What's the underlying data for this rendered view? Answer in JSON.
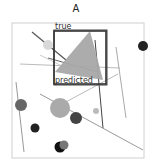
{
  "panel": {
    "label": "A"
  },
  "scene": {
    "frame": {
      "x": 12,
      "y": 23,
      "w": 132,
      "h": 135,
      "stroke": "#d0d0d0"
    },
    "boxes": {
      "true_label": "true",
      "predicted_label": "predicted",
      "true_box": {
        "x": 54,
        "y": 30,
        "w": 53,
        "h": 55,
        "stroke": "#444444"
      },
      "predicted_box": {
        "x": 54,
        "y": 31,
        "w": 52,
        "h": 53,
        "stroke": "#333333"
      }
    },
    "triangle": {
      "points": "90,31 103,80 55,72",
      "fill": "#a8a8a8"
    },
    "lines": [
      {
        "x1": 32,
        "y1": 32,
        "x2": 66,
        "y2": 60,
        "stroke": "#555555",
        "w": 1.2
      },
      {
        "x1": 48,
        "y1": 58,
        "x2": 98,
        "y2": 72,
        "stroke": "#666666",
        "w": 1
      },
      {
        "x1": 20,
        "y1": 64,
        "x2": 120,
        "y2": 68,
        "stroke": "#bbbbbb",
        "w": 1
      },
      {
        "x1": 40,
        "y1": 55,
        "x2": 70,
        "y2": 70,
        "stroke": "#cccccc",
        "w": 1
      },
      {
        "x1": 95,
        "y1": 40,
        "x2": 103,
        "y2": 128,
        "stroke": "#444444",
        "w": 1
      },
      {
        "x1": 116,
        "y1": 47,
        "x2": 126,
        "y2": 118,
        "stroke": "#aaaaaa",
        "w": 1
      },
      {
        "x1": 40,
        "y1": 94,
        "x2": 143,
        "y2": 150,
        "stroke": "#999999",
        "w": 1
      },
      {
        "x1": 62,
        "y1": 104,
        "x2": 118,
        "y2": 74,
        "stroke": "#bbbbbb",
        "w": 1
      },
      {
        "x1": 16,
        "y1": 82,
        "x2": 24,
        "y2": 152,
        "stroke": "#999999",
        "w": 1
      }
    ],
    "circles": [
      {
        "cx": 48,
        "cy": 45,
        "r": 5,
        "fill": "#d8d8d8"
      },
      {
        "cx": 143,
        "cy": 46,
        "r": 5,
        "fill": "#222222"
      },
      {
        "cx": 21,
        "cy": 105,
        "r": 6,
        "fill": "#666666"
      },
      {
        "cx": 60,
        "cy": 108,
        "r": 10,
        "fill": "#aaaaaa"
      },
      {
        "cx": 76,
        "cy": 118,
        "r": 6,
        "fill": "#444444"
      },
      {
        "cx": 96,
        "cy": 111,
        "r": 3,
        "fill": "#bbbbbb"
      },
      {
        "cx": 35,
        "cy": 128,
        "r": 4.5,
        "fill": "#222222"
      },
      {
        "cx": 60,
        "cy": 147,
        "r": 5.5,
        "fill": "#111111"
      },
      {
        "cx": 64,
        "cy": 145,
        "r": 4.5,
        "fill": "#777777"
      }
    ]
  }
}
